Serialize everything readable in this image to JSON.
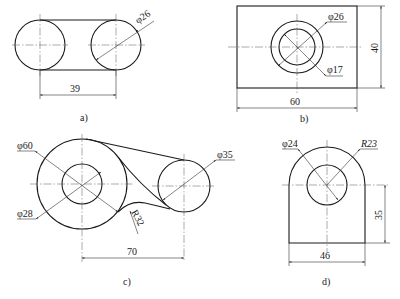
{
  "figures": [
    {
      "id": "a",
      "caption": "a)",
      "dimensions": {
        "diameter": "φ26",
        "center_distance": "39"
      }
    },
    {
      "id": "b",
      "caption": "b)",
      "dimensions": {
        "outer_diameter": "φ26",
        "inner_diameter": "φ17",
        "width": "60",
        "height": "40"
      }
    },
    {
      "id": "c",
      "caption": "c)",
      "dimensions": {
        "large_diameter": "φ60",
        "bore_diameter": "φ28",
        "small_diameter": "φ35",
        "fillet_radius": "R32",
        "center_distance": "70"
      }
    },
    {
      "id": "d",
      "caption": "d)",
      "dimensions": {
        "hole_diameter": "φ24",
        "arc_radius": "R23",
        "height": "35",
        "width": "46"
      }
    }
  ]
}
